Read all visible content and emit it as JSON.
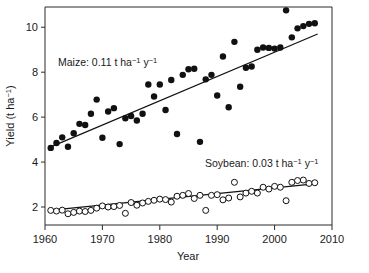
{
  "chart_data": {
    "type": "scatter",
    "title": "",
    "xlabel": "Year",
    "ylabel": "Yield (t ha⁻¹)",
    "xlim": [
      1960,
      2010
    ],
    "ylim": [
      1.2,
      10.9
    ],
    "xticks": [
      1960,
      1970,
      1980,
      1990,
      2000,
      2010
    ],
    "yticks": [
      2,
      4,
      6,
      8,
      10
    ],
    "grid": false,
    "legend_position": "inline-annotation",
    "annotations": [
      {
        "name": "maize-annotation",
        "text": "Maize: 0.11 t ha⁻¹ y⁻¹",
        "x": 1968.5,
        "y": 8.3
      },
      {
        "name": "soybean-annotation",
        "text": "Soybean: 0.03 t ha⁻¹ y⁻¹",
        "x": 1994.0,
        "y": 4.05
      }
    ],
    "series": [
      {
        "name": "Maize",
        "marker": "filled-circle",
        "color": "#111111",
        "slope_per_year": 0.11,
        "units": "t ha-1 y-1",
        "trend": {
          "x0": 1960.5,
          "y0": 4.62,
          "x1": 2007.5,
          "y1": 9.7
        },
        "x": [
          1961,
          1962,
          1963,
          1964,
          1965,
          1966,
          1967,
          1968,
          1969,
          1970,
          1971,
          1972,
          1973,
          1974,
          1975,
          1976,
          1977,
          1978,
          1979,
          1980,
          1981,
          1982,
          1983,
          1984,
          1985,
          1986,
          1987,
          1988,
          1989,
          1990,
          1991,
          1992,
          1993,
          1994,
          1995,
          1996,
          1997,
          1998,
          1999,
          2000,
          2001,
          2002,
          2003,
          2004,
          2005,
          2006,
          2007
        ],
        "y": [
          4.63,
          4.85,
          5.1,
          4.68,
          5.28,
          5.7,
          5.65,
          6.15,
          6.78,
          5.08,
          6.25,
          6.4,
          4.8,
          5.95,
          6.05,
          5.85,
          6.15,
          7.45,
          6.92,
          7.45,
          6.32,
          7.65,
          5.25,
          7.88,
          8.13,
          8.15,
          4.9,
          7.68,
          7.88,
          6.96,
          8.7,
          6.44,
          9.35,
          7.35,
          8.2,
          8.25,
          9.0,
          9.1,
          9.08,
          9.05,
          9.1,
          10.75,
          9.55,
          9.95,
          10.05,
          10.15,
          10.18
        ]
      },
      {
        "name": "Soybean",
        "marker": "open-circle",
        "color": "#111111",
        "slope_per_year": 0.03,
        "units": "t ha-1 y-1",
        "trend": {
          "x0": 1962.0,
          "y0": 1.88,
          "x1": 2006.5,
          "y1": 3.02
        },
        "x": [
          1961,
          1962,
          1963,
          1964,
          1965,
          1966,
          1967,
          1968,
          1969,
          1970,
          1971,
          1972,
          1973,
          1974,
          1975,
          1976,
          1977,
          1978,
          1979,
          1980,
          1981,
          1982,
          1983,
          1984,
          1985,
          1986,
          1987,
          1988,
          1989,
          1990,
          1991,
          1992,
          1993,
          1994,
          1995,
          1996,
          1997,
          1998,
          1999,
          2000,
          2001,
          2002,
          2003,
          2004,
          2005,
          2006,
          2007
        ],
        "y": [
          1.85,
          1.82,
          1.86,
          1.7,
          1.76,
          1.82,
          1.8,
          1.85,
          1.95,
          2.05,
          2.0,
          2.02,
          2.07,
          1.72,
          2.2,
          2.08,
          2.18,
          2.25,
          2.3,
          2.35,
          2.33,
          2.22,
          2.48,
          2.52,
          2.6,
          2.38,
          2.52,
          1.85,
          2.52,
          2.55,
          2.32,
          2.4,
          3.1,
          2.45,
          2.62,
          2.7,
          2.62,
          2.88,
          2.8,
          2.92,
          2.88,
          2.28,
          3.1,
          3.18,
          3.2,
          3.05,
          3.08
        ]
      }
    ]
  },
  "axes": {
    "x_tick_labels": [
      "1960",
      "1970",
      "1980",
      "1990",
      "2000",
      "2010"
    ],
    "y_tick_labels": [
      "2",
      "4",
      "6",
      "8",
      "10"
    ],
    "x_axis_title": "Year",
    "y_axis_title_parts": {
      "base": "Yield (t ha",
      "sup": "−1",
      "tail": ")"
    }
  },
  "annotations_text": {
    "maize_prefix": "Maize: 0.11 t ha",
    "maize_sup1": "−1",
    "maize_mid": " y",
    "maize_sup2": "−1",
    "soybean_prefix": "Soybean: 0.03 t ha",
    "soybean_sup1": "−1",
    "soybean_mid": " y",
    "soybean_sup2": "−1"
  },
  "colors": {
    "maize_marker": "#111111",
    "soybean_marker_fill": "#ffffff",
    "soybean_marker_stroke": "#111111",
    "axis": "#2b2b2b",
    "background": "#ffffff"
  }
}
